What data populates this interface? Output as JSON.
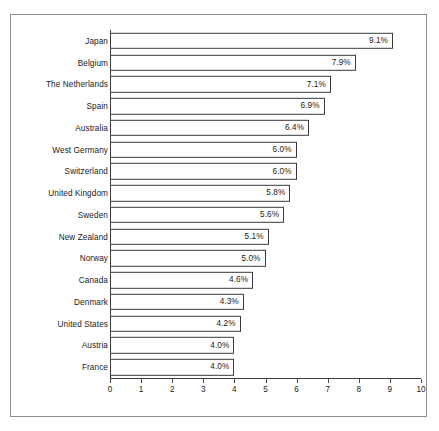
{
  "chart_data": {
    "type": "bar",
    "orientation": "horizontal",
    "title": "",
    "subtitle": "",
    "xlabel": "",
    "ylabel": "",
    "xlim": [
      0,
      10
    ],
    "xticks": [
      "0",
      "1",
      "2",
      "3",
      "4",
      "5",
      "6",
      "7",
      "8",
      "9",
      "10"
    ],
    "grid": false,
    "legend": null,
    "value_suffix": "%",
    "categories": [
      "Japan",
      "Belgium",
      "The Netherlands",
      "Spain",
      "Australia",
      "West Germany",
      "Switzerland",
      "United Kingdom",
      "Sweden",
      "New Zealand",
      "Norway",
      "Canada",
      "Denmark",
      "United States",
      "Austria",
      "France"
    ],
    "values": [
      9.1,
      7.9,
      7.1,
      6.9,
      6.4,
      6.0,
      6.0,
      5.8,
      5.6,
      5.1,
      5.0,
      4.6,
      4.3,
      4.2,
      4.0,
      4.0
    ],
    "value_labels": [
      "9.1%",
      "7.9%",
      "7.1%",
      "6.9%",
      "6.4%",
      "6.0%",
      "6.0%",
      "5.8%",
      "5.6%",
      "5.1%",
      "5.0%",
      "4.6%",
      "4.3%",
      "4.2%",
      "4.0%",
      "4.0%"
    ],
    "colors": {
      "bar_fill": "#ffffff",
      "bar_stroke": "#3a3a3a",
      "axis": "#3a3a3a",
      "text": "#1a1a1a",
      "frame": "#8d8d8d",
      "background": "#ffffff"
    }
  }
}
